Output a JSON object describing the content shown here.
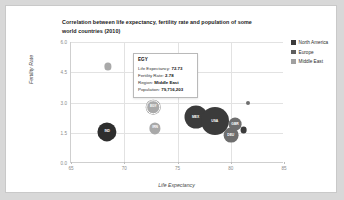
{
  "chart_data": {
    "type": "scatter",
    "title": "Correlation between life expectancy, fertility rate and population of some world countries (2010)",
    "xlabel": "Life Expectancy",
    "ylabel": "Fertility Rate",
    "xlim": [
      65,
      85
    ],
    "ylim": [
      0.0,
      6.0
    ],
    "xticks": [
      "65",
      "70",
      "75",
      "80",
      "85"
    ],
    "yticks": [
      "6.0",
      "4.5",
      "3.0",
      "1.5",
      "0.0"
    ],
    "grid": true,
    "legend_position": "right",
    "size_encoding": "Population",
    "series": [
      {
        "name": "North America",
        "color": "#3b3b3b",
        "points": [
          {
            "label": "MEX",
            "x": 76.7,
            "y": 2.28,
            "r": 11.5
          },
          {
            "label": "USA",
            "x": 78.5,
            "y": 2.06,
            "r": 14.0
          },
          {
            "label": "CAN",
            "x": 81.2,
            "y": 1.63,
            "r": 3.4
          }
        ]
      },
      {
        "name": "Europe",
        "color": "#6e6e6e",
        "points": [
          {
            "label": "DEU",
            "x": 80.0,
            "y": 1.39,
            "r": 7.4
          },
          {
            "label": "GBR",
            "x": 80.4,
            "y": 1.92,
            "r": 6.4
          },
          {
            "label": "ESP",
            "x": 81.6,
            "y": 2.98,
            "r": 2.0
          }
        ]
      },
      {
        "name": "Middle East",
        "color": "#a9a9a9",
        "points": [
          {
            "label": "YEM",
            "x": 68.5,
            "y": 4.79,
            "r": 3.6
          },
          {
            "label": "IRN",
            "x": 72.9,
            "y": 1.72,
            "r": 5.6
          },
          {
            "label": "EGY",
            "x": 72.73,
            "y": 2.78,
            "r": 6.8,
            "selected": true
          }
        ]
      }
    ],
    "extra_points": [
      {
        "label": "IND",
        "x": 68.4,
        "y": 1.54,
        "r": 9.6,
        "color": "#2e2e2e",
        "series": "North America"
      }
    ]
  },
  "tooltip": {
    "title": "EGY",
    "rows": [
      {
        "label": "Life Expectancy:",
        "value": "72.73"
      },
      {
        "label": "Fertility Rate:",
        "value": "2.78"
      },
      {
        "label": "Region:",
        "value": "Middle East"
      },
      {
        "label": "Population:",
        "value": "79,716,203"
      }
    ]
  },
  "legend": {
    "items": [
      {
        "label": "North America",
        "color": "#3b3b3b"
      },
      {
        "label": "Europe",
        "color": "#5e5e5e"
      },
      {
        "label": "Middle East",
        "color": "#a0a0a0"
      }
    ]
  }
}
